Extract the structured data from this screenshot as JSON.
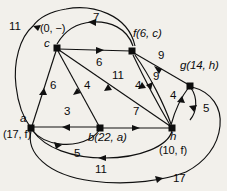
{
  "figure": {
    "name": "directed-weighted-graph",
    "background_color": "#f2f0eb",
    "stroke_color": "#101010",
    "width": 227,
    "height": 191
  },
  "nodes": [
    {
      "id": "c",
      "label": "c",
      "info": "(0, −)",
      "x": 57,
      "y": 48
    },
    {
      "id": "f",
      "label": "f",
      "info": "(6, c)",
      "x": 132,
      "y": 51
    },
    {
      "id": "g",
      "label": "g",
      "info": "(14, h)",
      "x": 190,
      "y": 86
    },
    {
      "id": "a",
      "label": "a",
      "info": "(17, f)",
      "x": 31,
      "y": 128
    },
    {
      "id": "b",
      "label": "b",
      "info": "(22, a)",
      "x": 100,
      "y": 128
    },
    {
      "id": "h",
      "label": "h",
      "info": "(10, f)",
      "x": 172,
      "y": 128
    }
  ],
  "node_labels": [
    {
      "name": "node-label-c",
      "text": "c",
      "x": 44,
      "y": 42
    },
    {
      "name": "node-info-c",
      "text": "(0, −)",
      "x": 40,
      "y": 28
    },
    {
      "name": "node-label-f",
      "text": "f(6, c)",
      "x": 134,
      "y": 33
    },
    {
      "name": "node-label-g",
      "text": "g(14, h)",
      "x": 185,
      "y": 65
    },
    {
      "name": "node-label-a",
      "text": "a",
      "x": 21,
      "y": 119
    },
    {
      "name": "node-info-a",
      "text": "(17, f)",
      "x": 5,
      "y": 133
    },
    {
      "name": "node-label-b",
      "text": "b(22, a)",
      "x": 88,
      "y": 134
    },
    {
      "name": "node-label-h",
      "text": "h",
      "x": 171,
      "y": 134
    },
    {
      "name": "node-info-h",
      "text": "(10, f)",
      "x": 161,
      "y": 148
    }
  ],
  "edges": [
    {
      "name": "edge-f-to-outer-11",
      "from": "f",
      "to": "a",
      "weight": "11"
    },
    {
      "name": "edge-f-to-c-7",
      "from": "f",
      "to": "c",
      "weight": "7"
    },
    {
      "name": "edge-c-to-f-6",
      "from": "c",
      "to": "f",
      "weight": "6"
    },
    {
      "name": "edge-f-to-g-9",
      "from": "f",
      "to": "g",
      "weight": "9"
    },
    {
      "name": "edge-h-to-f-9",
      "from": "h",
      "to": "f",
      "weight": "9"
    },
    {
      "name": "edge-a-to-c-6",
      "from": "a",
      "to": "c",
      "weight": "6"
    },
    {
      "name": "edge-b-to-c-4",
      "from": "b",
      "to": "c",
      "weight": "4"
    },
    {
      "name": "edge-h-to-c-11",
      "from": "h",
      "to": "c",
      "weight": "11"
    },
    {
      "name": "edge-h-to-f-4",
      "from": "h",
      "to": "f",
      "weight": "4"
    },
    {
      "name": "edge-h-to-g-4",
      "from": "h",
      "to": "g",
      "weight": "4"
    },
    {
      "name": "edge-g-to-h-5",
      "from": "g",
      "to": "h",
      "weight": "5"
    },
    {
      "name": "edge-b-to-a-3",
      "from": "b",
      "to": "a",
      "weight": "3"
    },
    {
      "name": "edge-a-to-b-5",
      "from": "a",
      "to": "b",
      "weight": "5"
    },
    {
      "name": "edge-b-to-h-7",
      "from": "b",
      "to": "h",
      "weight": "7"
    },
    {
      "name": "edge-h-to-a-11",
      "from": "h",
      "to": "a",
      "weight": "11"
    },
    {
      "name": "edge-a-to-h-17",
      "from": "a",
      "to": "h",
      "weight": "17"
    }
  ],
  "weight_labels": [
    {
      "name": "weight-label-11-topleft",
      "text": "11",
      "x": 11,
      "y": 26
    },
    {
      "name": "weight-label-7-top",
      "text": "7",
      "x": 94,
      "y": 17
    },
    {
      "name": "weight-label-6-cf",
      "text": "6",
      "x": 97,
      "y": 62
    },
    {
      "name": "weight-label-9-upper",
      "text": "9",
      "x": 159,
      "y": 55
    },
    {
      "name": "weight-label-9-lower",
      "text": "9",
      "x": 154,
      "y": 76
    },
    {
      "name": "weight-label-6-ac",
      "text": "6",
      "x": 50,
      "y": 85
    },
    {
      "name": "weight-label-4-bc",
      "text": "4",
      "x": 84,
      "y": 85
    },
    {
      "name": "weight-label-11-hc",
      "text": "11",
      "x": 115,
      "y": 75
    },
    {
      "name": "weight-label-4-hf",
      "text": "4",
      "x": 135,
      "y": 85
    },
    {
      "name": "weight-label-4-hg",
      "text": "4",
      "x": 170,
      "y": 95
    },
    {
      "name": "weight-label-5-gh",
      "text": "5",
      "x": 204,
      "y": 108
    },
    {
      "name": "weight-label-3-ba",
      "text": "3",
      "x": 64,
      "y": 111
    },
    {
      "name": "weight-label-7-bh",
      "text": "7",
      "x": 134,
      "y": 111
    },
    {
      "name": "weight-label-5-ab",
      "text": "5",
      "x": 74,
      "y": 152
    },
    {
      "name": "weight-label-11-ha",
      "text": "11",
      "x": 97,
      "y": 168
    },
    {
      "name": "weight-label-17-ah",
      "text": "17",
      "x": 174,
      "y": 177
    }
  ]
}
